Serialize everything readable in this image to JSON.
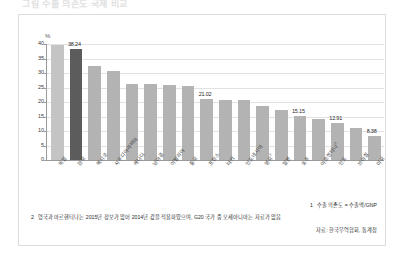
{
  "page": {
    "title": "그림 수출 의존도 국제 비교"
  },
  "chart_data": {
    "type": "bar",
    "title": "",
    "xlabel": "",
    "ylabel": "%",
    "ylim": [
      0,
      40
    ],
    "yticks": [
      0,
      5,
      10,
      15,
      20,
      25,
      30,
      35,
      40
    ],
    "grid": true,
    "legend": "",
    "categories": [
      "독일",
      "한국",
      "멕시코",
      "사우디아라비아",
      "캐나다",
      "남아공",
      "이탈리아",
      "중국",
      "프랑스",
      "터키",
      "인도네시아",
      "영국",
      "일본",
      "호주",
      "아르헨티나",
      "인도",
      "브라질",
      "미국"
    ],
    "category_notes": {
      "영국": "2",
      "아르헨티나": "2"
    },
    "values": [
      39.5,
      38.24,
      32.3,
      30.8,
      26.3,
      26.3,
      25.7,
      25.6,
      21.02,
      20.8,
      20.8,
      18.6,
      17.3,
      15.15,
      14.1,
      12.91,
      11.0,
      8.38
    ],
    "highlight_index": 1,
    "value_labels": {
      "1": "38.24",
      "8": "21.02",
      "13": "15.15",
      "15": "12.91",
      "17": "8.38"
    },
    "colors": {
      "bar": "#b3b3b3",
      "bar_highlight": "#5c5c5c",
      "bar_first": "#c4c4c4",
      "grid": "#e2e2e2",
      "axis": "#9a9a9a"
    }
  },
  "notes": {
    "note1_num": "1",
    "note1_text": "수출 의존도 = 수출액/GNP",
    "note2_num": "2",
    "note2_text": "영국과 아르헨티나는 2015년 정보가 없어 2014년 값을 적용하였으며, G20 국가 중 오세아니아는 자료가 없음",
    "source": "자료: 한국무역협회, 통계청"
  }
}
